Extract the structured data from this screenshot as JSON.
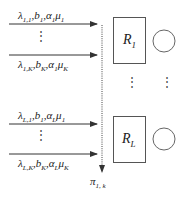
{
  "diagram": {
    "groups": [
      {
        "id": "group-1",
        "top_label": {
          "lambda": "1,1",
          "b": "1",
          "alpha": "1",
          "mu": "1"
        },
        "bottom_label": {
          "lambda": "1,K",
          "b": "K",
          "alpha": "1",
          "mu": "K"
        },
        "server": {
          "R": "1"
        }
      },
      {
        "id": "group-L",
        "top_label": {
          "lambda": "L,1",
          "b": "1",
          "alpha": "L",
          "mu": "1"
        },
        "bottom_label": {
          "lambda": "L,K",
          "b": "K",
          "alpha": "L",
          "mu": "K"
        },
        "server": {
          "R": "L"
        }
      }
    ],
    "vdots": "⋮",
    "output_label": {
      "pi": "1, k"
    },
    "symbols": {
      "lambda": "λ",
      "b": "b",
      "alpha": "α",
      "mu": "μ",
      "pi": "π",
      "R": "R",
      "comma": ","
    },
    "colors": {
      "stroke": "#333333",
      "background": "#ffffff"
    }
  }
}
